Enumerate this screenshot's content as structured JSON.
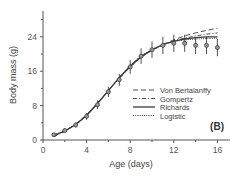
{
  "chart_data": {
    "type": "line",
    "title": "",
    "panel_label": "(B)",
    "xlabel": "Age (days)",
    "ylabel": "Body mass (g)",
    "xlim": [
      0,
      17
    ],
    "ylim": [
      0,
      29
    ],
    "xticks": [
      0,
      4,
      8,
      12,
      16
    ],
    "yticks": [
      0,
      8,
      16,
      24
    ],
    "x_minor_ticks": [
      2,
      6,
      10,
      14
    ],
    "y_minor_ticks": [
      4,
      12,
      20,
      28
    ],
    "grid": false,
    "legend_position": "lower right",
    "observed": {
      "name": "Observed mean ± SD",
      "x": [
        1,
        2,
        3,
        4,
        5,
        6,
        7,
        8,
        9,
        10,
        11,
        12,
        13,
        14,
        15,
        16
      ],
      "y": [
        1.2,
        2.2,
        3.5,
        5.5,
        8.2,
        11.2,
        14.0,
        17.0,
        19.5,
        21.0,
        22.0,
        22.5,
        22.5,
        22.0,
        22.0,
        21.5
      ],
      "err": [
        0.4,
        0.5,
        0.6,
        0.8,
        1.0,
        1.2,
        1.4,
        1.6,
        1.8,
        1.9,
        2.0,
        2.0,
        2.0,
        2.0,
        2.0,
        2.0
      ]
    },
    "series": [
      {
        "name": "Von Bertalanffy",
        "style": "dashed",
        "x": [
          1,
          2,
          3,
          4,
          5,
          6,
          7,
          8,
          9,
          10,
          11,
          12,
          13,
          14,
          15,
          16
        ],
        "y": [
          0.9,
          2.1,
          3.7,
          5.9,
          8.6,
          11.5,
          14.4,
          17.0,
          19.2,
          20.9,
          22.2,
          23.3,
          24.2,
          24.9,
          25.5,
          26.0
        ]
      },
      {
        "name": "Gompertz",
        "style": "dashdot",
        "x": [
          1,
          2,
          3,
          4,
          5,
          6,
          7,
          8,
          9,
          10,
          11,
          12,
          13,
          14,
          15,
          16
        ],
        "y": [
          0.8,
          2.0,
          3.6,
          5.8,
          8.5,
          11.5,
          14.4,
          17.0,
          19.2,
          20.9,
          22.1,
          23.0,
          23.7,
          24.2,
          24.6,
          24.9
        ]
      },
      {
        "name": "Richards",
        "style": "solid",
        "x": [
          1,
          2,
          3,
          4,
          5,
          6,
          7,
          8,
          9,
          10,
          11,
          12,
          13,
          14,
          15,
          16
        ],
        "y": [
          1.1,
          2.1,
          3.6,
          5.7,
          8.5,
          11.5,
          14.5,
          17.2,
          19.4,
          21.0,
          22.2,
          23.0,
          23.5,
          23.8,
          24.0,
          24.0
        ]
      },
      {
        "name": "Logistic",
        "style": "dotted",
        "x": [
          1,
          2,
          3,
          4,
          5,
          6,
          7,
          8,
          9,
          10,
          11,
          12,
          13,
          14,
          15,
          16
        ],
        "y": [
          1.2,
          2.1,
          3.5,
          5.6,
          8.4,
          11.5,
          14.6,
          17.4,
          19.6,
          21.1,
          22.2,
          22.9,
          23.3,
          23.5,
          23.6,
          23.7
        ]
      }
    ]
  },
  "colors": {
    "axis": "#555555",
    "line": "#3a3a3a",
    "marker_fill": "#9a9a9a"
  }
}
